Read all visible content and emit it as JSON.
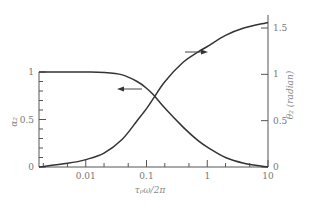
{
  "chart_data": {
    "type": "line",
    "title": "",
    "xlabel": "τ_p ω / 2π",
    "ylabel_left": "α_2",
    "ylabel_right": "θ_2 (radian)",
    "xscale": "log",
    "xlim": [
      0.0017,
      10
    ],
    "ylim_left": [
      0,
      1
    ],
    "ylim_right": [
      0,
      1.6
    ],
    "x_ticks": [
      "0.01",
      "0.1",
      "1",
      "10"
    ],
    "y_left_ticks": [
      "0",
      "0.5",
      "1"
    ],
    "y_right_ticks": [
      "0",
      "0.5",
      "1",
      "1.5"
    ],
    "grid": false,
    "series": [
      {
        "name": "α_2",
        "axis": "left",
        "x": [
          0.0017,
          0.005,
          0.01,
          0.02,
          0.04,
          0.07,
          0.1,
          0.13,
          0.2,
          0.4,
          0.7,
          1,
          2,
          4,
          10
        ],
        "values": [
          1.0,
          1.0,
          1.0,
          0.995,
          0.97,
          0.9,
          0.83,
          0.76,
          0.62,
          0.42,
          0.28,
          0.21,
          0.1,
          0.04,
          0.0
        ]
      },
      {
        "name": "θ_2",
        "axis": "right",
        "x": [
          0.0017,
          0.005,
          0.01,
          0.02,
          0.04,
          0.07,
          0.1,
          0.13,
          0.2,
          0.4,
          0.7,
          1,
          2,
          4,
          10
        ],
        "values": [
          0.0,
          0.04,
          0.08,
          0.15,
          0.3,
          0.5,
          0.63,
          0.74,
          0.92,
          1.13,
          1.24,
          1.3,
          1.42,
          1.5,
          1.56
        ]
      }
    ],
    "annotations": [
      {
        "type": "arrow",
        "direction": "left",
        "refers_to": "α_2"
      },
      {
        "type": "arrow",
        "direction": "right",
        "refers_to": "θ_2"
      }
    ]
  }
}
